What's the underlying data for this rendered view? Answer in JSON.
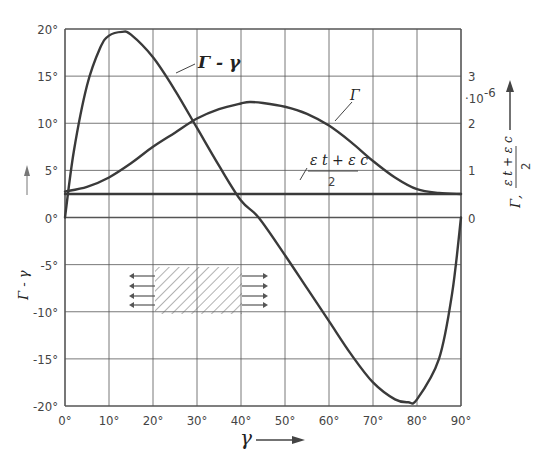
{
  "chart_data": {
    "type": "line",
    "title": "",
    "xlabel": "γ",
    "ylabel_left": "Γ - γ",
    "ylabel_right": "Γ, (ε_t + ε_c)/2",
    "right_axis_multiplier": "·10^-6",
    "xlim": [
      0,
      90
    ],
    "ylim_left": [
      -20,
      20
    ],
    "ylim_right": [
      0,
      3
    ],
    "grid": true,
    "x_ticks": [
      "0°",
      "10°",
      "20°",
      "30°",
      "40°",
      "50°",
      "60°",
      "70°",
      "80°",
      "90°"
    ],
    "y_ticks_left": [
      "20°",
      "15°",
      "10°",
      "5°",
      "0°",
      "-5°",
      "-10°",
      "-15°",
      "-20°"
    ],
    "y_ticks_right": [
      "3",
      "2",
      "1",
      "0"
    ],
    "series": [
      {
        "name": "Γ - γ",
        "axis": "left",
        "x": [
          0,
          2,
          5,
          8,
          10,
          13,
          15,
          20,
          25,
          30,
          35,
          40,
          44,
          50,
          55,
          60,
          65,
          70,
          75,
          78,
          80,
          85,
          88,
          90
        ],
        "y": [
          0,
          7,
          14,
          18,
          19.3,
          19.7,
          19.4,
          17,
          13.5,
          9.5,
          5.5,
          1.8,
          0,
          -4,
          -7.5,
          -11,
          -14.5,
          -17.5,
          -19.3,
          -19.6,
          -19.3,
          -15,
          -8,
          0
        ]
      },
      {
        "name": "Γ",
        "axis": "right",
        "x": [
          0,
          5,
          10,
          15,
          20,
          25,
          30,
          35,
          40,
          42,
          45,
          50,
          55,
          60,
          65,
          70,
          75,
          80,
          85,
          90
        ],
        "y": [
          0.55,
          0.65,
          0.85,
          1.15,
          1.5,
          1.8,
          2.1,
          2.3,
          2.42,
          2.45,
          2.43,
          2.35,
          2.2,
          1.95,
          1.6,
          1.2,
          0.85,
          0.6,
          0.52,
          0.5
        ]
      },
      {
        "name": "(ε_t + ε_c)/2",
        "axis": "right",
        "x": [
          0,
          90
        ],
        "y": [
          0.5,
          0.5
        ]
      }
    ],
    "annotations": [
      "Γ - γ",
      "Γ",
      "(ε_t + ε_c)/2",
      "hatched element under tension (arrows left and right)"
    ]
  },
  "labels": {
    "curve_gamma_minus": "Γ - γ",
    "curve_gamma": "Γ",
    "eps_num": "ε t + ε c",
    "eps_den": "2",
    "x_axis": "γ",
    "left_axis": "Γ - γ",
    "right_axis_mult": "·10",
    "right_axis_exp": "-6",
    "right_axis_label": "Γ, ",
    "right_axis_frac_num": "ε t + ε c",
    "right_axis_frac_den": "2"
  }
}
